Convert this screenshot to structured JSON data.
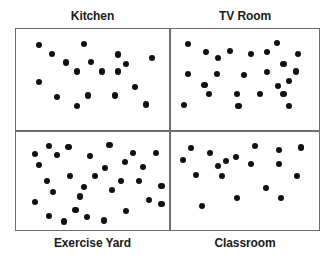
{
  "figure": {
    "title": "",
    "background_color": "#ffffff",
    "frame_color": "#6e6e6e",
    "dot_color": "#111111"
  },
  "chart_data": {
    "type": "scatter",
    "title": "",
    "xlabel": "",
    "ylabel": "",
    "grid": false,
    "legend_position": "none",
    "layout": "2x2 panel grid",
    "axis_ranges": {
      "x": [
        0,
        100
      ],
      "y": [
        0,
        100
      ]
    },
    "panels": [
      {
        "id": "kitchen",
        "label": "Kitchen",
        "label_position": "above",
        "grid_cell": "top-left",
        "count": 18,
        "points": [
          [
            12,
            11
          ],
          [
            44,
            10
          ],
          [
            21,
            21
          ],
          [
            68,
            22
          ],
          [
            92,
            26
          ],
          [
            31,
            31
          ],
          [
            49,
            30
          ],
          [
            39,
            41
          ],
          [
            57,
            41
          ],
          [
            68,
            41
          ],
          [
            74,
            33
          ],
          [
            12,
            53
          ],
          [
            80,
            58
          ],
          [
            25,
            70
          ],
          [
            47,
            68
          ],
          [
            66,
            68
          ],
          [
            39,
            80
          ],
          [
            88,
            78
          ]
        ]
      },
      {
        "id": "tv-room",
        "label": "TV Room",
        "label_position": "above",
        "grid_cell": "top-right",
        "count": 24,
        "points": [
          [
            9,
            10
          ],
          [
            74,
            9
          ],
          [
            22,
            19
          ],
          [
            40,
            18
          ],
          [
            55,
            21
          ],
          [
            67,
            19
          ],
          [
            90,
            21
          ],
          [
            31,
            26
          ],
          [
            79,
            33
          ],
          [
            9,
            44
          ],
          [
            30,
            44
          ],
          [
            50,
            45
          ],
          [
            67,
            42
          ],
          [
            88,
            41
          ],
          [
            21,
            56
          ],
          [
            75,
            57
          ],
          [
            83,
            52
          ],
          [
            24,
            66
          ],
          [
            45,
            66
          ],
          [
            62,
            66
          ],
          [
            79,
            66
          ],
          [
            6,
            79
          ],
          [
            46,
            80
          ],
          [
            83,
            80
          ]
        ]
      },
      {
        "id": "exercise-yard",
        "label": "Exercise Yard",
        "label_position": "below",
        "grid_cell": "bottom-left",
        "count": 31,
        "points": [
          [
            19,
            9
          ],
          [
            33,
            10
          ],
          [
            62,
            8
          ],
          [
            9,
            19
          ],
          [
            25,
            20
          ],
          [
            48,
            21
          ],
          [
            79,
            17
          ],
          [
            95,
            17
          ],
          [
            12,
            31
          ],
          [
            73,
            28
          ],
          [
            59,
            35
          ],
          [
            86,
            34
          ],
          [
            34,
            44
          ],
          [
            52,
            44
          ],
          [
            18,
            50
          ],
          [
            70,
            50
          ],
          [
            83,
            50
          ],
          [
            44,
            57
          ],
          [
            64,
            60
          ],
          [
            99,
            56
          ],
          [
            22,
            63
          ],
          [
            41,
            68
          ],
          [
            9,
            74
          ],
          [
            90,
            72
          ],
          [
            99,
            77
          ],
          [
            38,
            84
          ],
          [
            74,
            85
          ],
          [
            19,
            91
          ],
          [
            46,
            92
          ],
          [
            30,
            97
          ],
          [
            58,
            96
          ]
        ]
      },
      {
        "id": "classroom",
        "label": "Classroom",
        "label_position": "below",
        "grid_cell": "bottom-right",
        "count": 19,
        "points": [
          [
            11,
            12
          ],
          [
            25,
            17
          ],
          [
            58,
            9
          ],
          [
            76,
            14
          ],
          [
            92,
            11
          ],
          [
            5,
            26
          ],
          [
            44,
            22
          ],
          [
            31,
            33
          ],
          [
            37,
            27
          ],
          [
            55,
            30
          ],
          [
            76,
            30
          ],
          [
            15,
            43
          ],
          [
            34,
            44
          ],
          [
            89,
            44
          ],
          [
            66,
            58
          ],
          [
            45,
            70
          ],
          [
            77,
            70
          ],
          [
            19,
            79
          ]
        ]
      }
    ]
  }
}
